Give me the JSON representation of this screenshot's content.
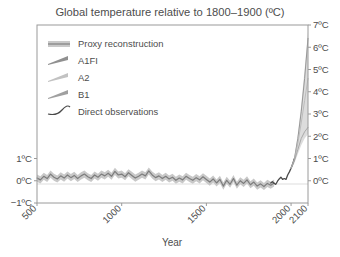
{
  "chart_data": {
    "type": "line",
    "title": "Global temperature relative to 1800–1900 (ºC)",
    "xlabel": "Year",
    "ylabel": "",
    "xlim": [
      500,
      2100
    ],
    "ylim": [
      -1,
      7
    ],
    "grid": false,
    "legend_position": "upper-left",
    "xticks": [
      500,
      1000,
      1500,
      2000,
      2100
    ],
    "xticklabels": [
      "500",
      "1000",
      "1500",
      "2000",
      "2100"
    ],
    "left_yticks": [
      -1,
      0,
      1
    ],
    "left_yticklabels": [
      "−1ºC",
      "0ºC",
      "1ºC"
    ],
    "right_yticks": [
      0,
      1,
      2,
      3,
      4,
      5,
      6,
      7
    ],
    "right_yticklabels": [
      "0ºC",
      "1ºC",
      "2ºC",
      "3ºC",
      "4ºC",
      "5ºC",
      "6ºC",
      "7ºC"
    ],
    "legend": [
      {
        "name": "Proxy reconstruction",
        "marker": "band",
        "color": "#8a8a8a"
      },
      {
        "name": "A1FI",
        "marker": "wedge",
        "color": "#909090"
      },
      {
        "name": "A2",
        "marker": "wedge",
        "color": "#c2c2c2"
      },
      {
        "name": "B1",
        "marker": "wedge",
        "color": "#a0a0a0"
      },
      {
        "name": "Direct observations",
        "marker": "line",
        "color": "#4a4a4a"
      }
    ],
    "series": [
      {
        "name": "Proxy reconstruction",
        "color": "#7d7d7d",
        "band_color": "#c8c8c8",
        "band_halfwidth": 0.16,
        "x": [
          500,
          520,
          540,
          560,
          580,
          600,
          620,
          640,
          660,
          680,
          700,
          720,
          740,
          760,
          780,
          800,
          820,
          840,
          860,
          880,
          900,
          920,
          940,
          960,
          980,
          1000,
          1020,
          1040,
          1060,
          1080,
          1100,
          1120,
          1140,
          1160,
          1180,
          1200,
          1220,
          1240,
          1260,
          1280,
          1300,
          1320,
          1340,
          1360,
          1380,
          1400,
          1420,
          1440,
          1460,
          1480,
          1500,
          1520,
          1540,
          1560,
          1580,
          1600,
          1620,
          1640,
          1660,
          1680,
          1700,
          1720,
          1740,
          1760,
          1780,
          1800,
          1820,
          1840,
          1860,
          1880,
          1900
        ],
        "y": [
          0.12,
          0.04,
          0.2,
          0.1,
          0.3,
          0.16,
          0.08,
          0.22,
          0.12,
          0.26,
          0.14,
          0.24,
          0.1,
          0.22,
          0.3,
          0.18,
          0.1,
          0.26,
          0.16,
          0.3,
          0.22,
          0.34,
          0.2,
          0.42,
          0.26,
          0.3,
          0.18,
          0.36,
          0.24,
          0.12,
          0.2,
          0.3,
          0.22,
          0.44,
          0.26,
          0.14,
          0.22,
          0.1,
          0.2,
          0.08,
          0.16,
          0.02,
          0.12,
          0.04,
          0.2,
          0.1,
          0.02,
          0.14,
          0.04,
          0.18,
          0.06,
          -0.06,
          0.08,
          -0.1,
          0.06,
          -0.24,
          0.02,
          -0.16,
          0.1,
          -0.2,
          0.0,
          -0.12,
          0.04,
          -0.18,
          -0.06,
          -0.24,
          -0.14,
          -0.26,
          -0.12,
          -0.2,
          -0.1
        ]
      },
      {
        "name": "Direct observations",
        "color": "#4a4a4a",
        "x": [
          1880,
          1890,
          1900,
          1910,
          1920,
          1930,
          1940,
          1950,
          1960,
          1970,
          1980,
          1990,
          2000,
          2010,
          2020
        ],
        "y": [
          -0.1,
          -0.04,
          -0.12,
          -0.16,
          -0.02,
          0.08,
          0.16,
          0.06,
          0.1,
          0.06,
          0.26,
          0.4,
          0.56,
          0.76,
          1.0
        ]
      },
      {
        "name": "A1FI",
        "color": "#8f8f8f",
        "x": [
          2000,
          2020,
          2040,
          2060,
          2080,
          2100
        ],
        "y": [
          0.56,
          1.0,
          1.9,
          3.1,
          4.6,
          6.4
        ]
      },
      {
        "name": "A2",
        "color": "#b8b8b8",
        "x": [
          2000,
          2020,
          2040,
          2060,
          2080,
          2100
        ],
        "y": [
          0.56,
          0.95,
          1.7,
          2.6,
          3.6,
          4.6
        ]
      },
      {
        "name": "B1",
        "color": "#a3a3a3",
        "x": [
          2000,
          2020,
          2040,
          2060,
          2080,
          2100
        ],
        "y": [
          0.56,
          0.9,
          1.4,
          1.9,
          2.2,
          2.4
        ]
      }
    ],
    "projection_fan": {
      "lower_name": "B1-low",
      "upper_name": "A1FI-high",
      "fill_color": "#dcdcdc",
      "x": [
        2000,
        2020,
        2040,
        2060,
        2080,
        2100
      ],
      "y_low": [
        0.5,
        0.8,
        1.2,
        1.6,
        1.9,
        2.1
      ],
      "y_high": [
        0.62,
        1.1,
        2.1,
        3.4,
        5.0,
        6.7
      ]
    }
  },
  "colors": {
    "frame": "#9a9a9a",
    "text": "#4d4d4d",
    "zero_line": "#cfcfcf",
    "background": "#ffffff"
  }
}
